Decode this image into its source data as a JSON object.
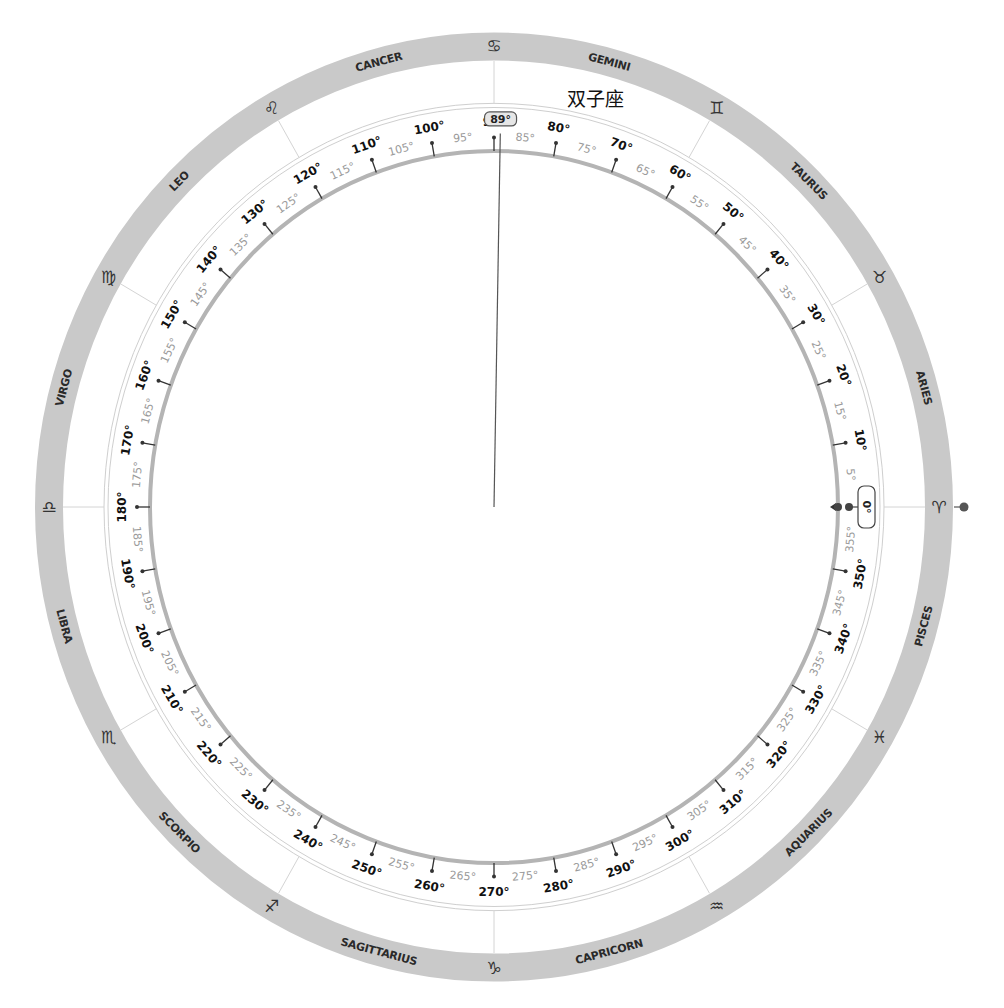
{
  "wheel": {
    "center": [
      494,
      507
    ],
    "y_scale": 1.035,
    "colors": {
      "ring": "#c9c9c9",
      "scale_arc": "#b4b4b4",
      "thin_circle": "#cfcfcf",
      "tick": "#333333",
      "label_major": "#111111",
      "label_minor": "#9a9a9a",
      "needle": "#555555"
    },
    "signs": [
      {
        "name": "ARIES",
        "glyph": "♈",
        "start_deg": 0
      },
      {
        "name": "TAURUS",
        "glyph": "♉",
        "start_deg": 30
      },
      {
        "name": "GEMINI",
        "glyph": "♊",
        "start_deg": 60
      },
      {
        "name": "CANCER",
        "glyph": "♋",
        "start_deg": 90
      },
      {
        "name": "LEO",
        "glyph": "♌",
        "start_deg": 120
      },
      {
        "name": "VIRGO",
        "glyph": "♍",
        "start_deg": 150
      },
      {
        "name": "LIBRA",
        "glyph": "♎",
        "start_deg": 180
      },
      {
        "name": "SCORPIO",
        "glyph": "♏",
        "start_deg": 210
      },
      {
        "name": "SAGITTARIUS",
        "glyph": "♐",
        "start_deg": 240
      },
      {
        "name": "CAPRICORN",
        "glyph": "♑",
        "start_deg": 270
      },
      {
        "name": "AQUARIUS",
        "glyph": "♒",
        "start_deg": 300
      },
      {
        "name": "PISCES",
        "glyph": "♓",
        "start_deg": 330
      }
    ],
    "scale": {
      "major_step_deg": 10,
      "minor_step_deg": 5,
      "degree_suffix": "°"
    },
    "needle": {
      "angle_deg": 89,
      "badge_text": "89°"
    },
    "origin_marker": {
      "angle_deg": 0,
      "badge_text": "0°"
    },
    "current_sign_label": "双子座"
  }
}
